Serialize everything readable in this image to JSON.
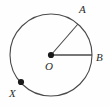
{
  "figure": {
    "type": "circle-diagram",
    "background_color": "#fefefe",
    "stroke_color": "#4a4a4a",
    "point_color": "#1a1a1a",
    "label_color": "#2b2b2b",
    "circle": {
      "center_label": "O",
      "center_x": 51,
      "center_y": 55,
      "radius": 41
    },
    "points": [
      {
        "label": "A",
        "on_circle": true,
        "angle_deg": 310,
        "x": 78,
        "y": 24,
        "label_x": 79,
        "label_y": 13,
        "marked_dot": false
      },
      {
        "label": "B",
        "on_circle": true,
        "angle_deg": 0,
        "x": 92,
        "y": 55,
        "label_x": 96,
        "label_y": 61,
        "marked_dot": false
      },
      {
        "label": "O",
        "on_circle": false,
        "angle_deg": 0,
        "x": 51,
        "y": 55,
        "label_x": 45,
        "label_y": 70,
        "marked_dot": true
      },
      {
        "label": "X",
        "on_circle": true,
        "angle_deg": 142,
        "x": 21,
        "y": 82,
        "label_x": 9,
        "label_y": 97,
        "marked_dot": true
      }
    ],
    "radii": [
      {
        "name": "radius-OA",
        "from": "O",
        "to": "A"
      },
      {
        "name": "radius-OB",
        "from": "O",
        "to": "B"
      }
    ]
  }
}
